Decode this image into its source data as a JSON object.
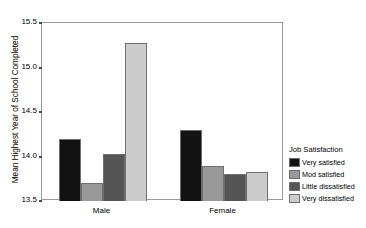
{
  "chart_data": {
    "type": "bar",
    "title": "",
    "xlabel": "",
    "ylabel": "Mean Highest Year of School Completed",
    "ylim": [
      13.5,
      15.5
    ],
    "yticks": [
      13.5,
      14.0,
      14.5,
      15.0,
      15.5
    ],
    "ytick_labels": [
      "13.5",
      "14.0",
      "14.5",
      "15.0",
      "15.5"
    ],
    "categories": [
      "Male",
      "Female"
    ],
    "grid": false,
    "legend_position": "right",
    "legend_title": "Job Satisfaction",
    "series": [
      {
        "name": "Very satisfied",
        "color": "#121212",
        "values": [
          14.2,
          14.3
        ]
      },
      {
        "name": "Mod satisfied",
        "color": "#999999",
        "values": [
          13.7,
          13.89
        ]
      },
      {
        "name": "Little dissatisfied",
        "color": "#555555",
        "values": [
          14.03,
          13.8
        ]
      },
      {
        "name": "Very dissatisfied",
        "color": "#cccccc",
        "values": [
          15.27,
          13.83
        ]
      }
    ]
  }
}
